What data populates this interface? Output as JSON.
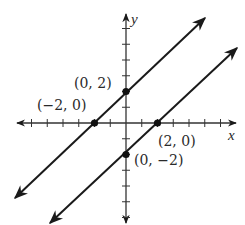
{
  "chart_data": {
    "type": "line",
    "title": "",
    "xlabel": "x",
    "ylabel": "y",
    "xlim": [
      -6.5,
      7
    ],
    "ylim": [
      -6.5,
      7
    ],
    "grid": false,
    "legend": null,
    "tick_step": 1,
    "series": [
      {
        "name": "upper line",
        "equation": "y = x + 2",
        "x": [
          -7,
          5
        ],
        "y": [
          -5,
          7
        ]
      },
      {
        "name": "lower line",
        "equation": "y = x - 2",
        "x": [
          -5,
          7
        ],
        "y": [
          -7,
          5
        ]
      }
    ],
    "points": [
      {
        "x": 0,
        "y": 2,
        "label": "(0, 2)"
      },
      {
        "x": -2,
        "y": 0,
        "label": "(−2, 0)"
      },
      {
        "x": 2,
        "y": 0,
        "label": "(2, 0)"
      },
      {
        "x": 0,
        "y": -2,
        "label": "(0, −2)"
      }
    ]
  },
  "labels": {
    "x_axis": "x",
    "y_axis": "y",
    "p1": "(0, 2)",
    "p2": "(−2, 0)",
    "p3": "(2, 0)",
    "p4": "(0, −2)"
  }
}
